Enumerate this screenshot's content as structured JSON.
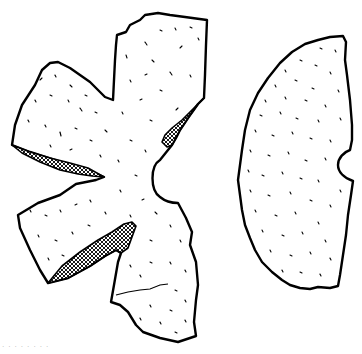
{
  "illustration": {
    "subject": "artifact fragment drawing",
    "fragments": [
      {
        "name": "star-shaped fragment",
        "position": "left"
      },
      {
        "name": "half-disc fragment",
        "position": "right"
      }
    ],
    "colors": {
      "ink": "#000000",
      "background": "#ffffff"
    }
  },
  "caption": {
    "text": "· · ·   · ·  ·     ·  ·"
  }
}
